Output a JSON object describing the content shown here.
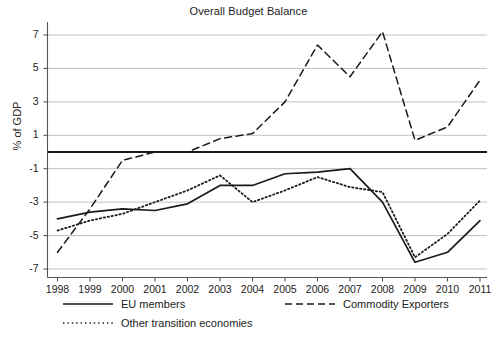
{
  "chart_data": {
    "type": "line",
    "title": "Overall Budget Balance",
    "xlabel": "",
    "ylabel": "% of GDP",
    "grid": true,
    "legend_position": "bottom",
    "xlim": [
      1998,
      2011
    ],
    "ylim": [
      -8,
      8
    ],
    "yticks": [
      7,
      5,
      3,
      1,
      -1,
      -3,
      -5,
      -7
    ],
    "ytick_labels": [
      "7",
      "5",
      "3",
      "1",
      "-1",
      "-3",
      "-5",
      "-7"
    ],
    "x": [
      1998,
      1999,
      2000,
      2001,
      2002,
      2003,
      2004,
      2005,
      2006,
      2007,
      2008,
      2009,
      2010,
      2011
    ],
    "xtick_labels": [
      "1998",
      "1999",
      "2000",
      "2001",
      "2002",
      "2003",
      "2004",
      "2005",
      "2006",
      "2007",
      "2008",
      "2009",
      "2010",
      "2011"
    ],
    "zero_line": 0,
    "series": [
      {
        "name": "EU members",
        "style": "solid",
        "color": "#1a1a1a",
        "values": [
          -4.0,
          -3.6,
          -3.4,
          -3.5,
          -3.1,
          -2.0,
          -2.0,
          -1.3,
          -1.2,
          -1.0,
          -3.0,
          -6.6,
          -6.0,
          -4.1
        ]
      },
      {
        "name": "Commodity Exporters",
        "style": "dashed",
        "color": "#1a1a1a",
        "values": [
          -6.0,
          -3.4,
          -0.5,
          0.0,
          0.0,
          0.8,
          1.1,
          3.0,
          6.4,
          4.5,
          7.2,
          0.7,
          1.5,
          4.3
        ]
      },
      {
        "name": "Other transition economies",
        "style": "dotted",
        "color": "#1a1a1a",
        "values": [
          -4.7,
          -4.1,
          -3.7,
          -3.0,
          -2.3,
          -1.4,
          -3.0,
          -2.3,
          -1.5,
          -2.1,
          -2.4,
          -6.3,
          -4.9,
          -2.9
        ]
      }
    ]
  },
  "legend": {
    "items": [
      {
        "label": "EU members",
        "style": "solid"
      },
      {
        "label": "Commodity Exporters",
        "style": "dashed"
      },
      {
        "label": "Other transition economies",
        "style": "dotted"
      }
    ]
  }
}
